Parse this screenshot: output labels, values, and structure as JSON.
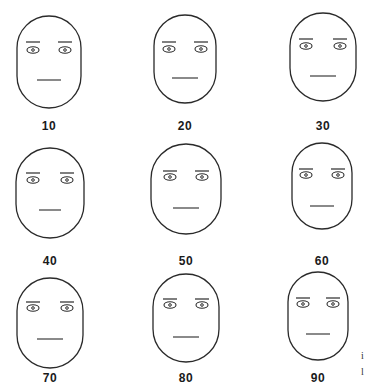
{
  "figure": {
    "stroke_color": "#2a2a2a",
    "background": "#ffffff"
  },
  "faces": [
    {
      "label": "10",
      "cx": 49,
      "cy": 62,
      "rx": 32,
      "ry": 46,
      "eye_y": 50,
      "eye_dx": 16,
      "brow_y": 42,
      "mouth_y": 80,
      "mouth_w": 24
    },
    {
      "label": "20",
      "cx": 185,
      "cy": 59,
      "rx": 31,
      "ry": 44,
      "eye_y": 49,
      "eye_dx": 16,
      "brow_y": 42,
      "mouth_y": 78,
      "mouth_w": 26
    },
    {
      "label": "30",
      "cx": 323,
      "cy": 57,
      "rx": 33,
      "ry": 44,
      "eye_y": 46,
      "eye_dx": 17,
      "brow_y": 39,
      "mouth_y": 76,
      "mouth_w": 26
    },
    {
      "label": "40",
      "cx": 50,
      "cy": 193,
      "rx": 34,
      "ry": 45,
      "eye_y": 180,
      "eye_dx": 17,
      "brow_y": 173,
      "mouth_y": 210,
      "mouth_w": 22
    },
    {
      "label": "50",
      "cx": 186,
      "cy": 189,
      "rx": 35,
      "ry": 45,
      "eye_y": 177,
      "eye_dx": 16,
      "brow_y": 171,
      "mouth_y": 208,
      "mouth_w": 26
    },
    {
      "label": "60",
      "cx": 322,
      "cy": 186,
      "rx": 30,
      "ry": 43,
      "eye_y": 175,
      "eye_dx": 16,
      "brow_y": 169,
      "mouth_y": 206,
      "mouth_w": 24
    },
    {
      "label": "70",
      "cx": 50,
      "cy": 323,
      "rx": 33,
      "ry": 45,
      "eye_y": 308,
      "eye_dx": 17,
      "brow_y": 302,
      "mouth_y": 339,
      "mouth_w": 26
    },
    {
      "label": "80",
      "cx": 186,
      "cy": 318,
      "rx": 33,
      "ry": 44,
      "eye_y": 305,
      "eye_dx": 16,
      "brow_y": 299,
      "mouth_y": 337,
      "mouth_w": 26
    },
    {
      "label": "90",
      "cx": 318,
      "cy": 316,
      "rx": 30,
      "ry": 44,
      "eye_y": 304,
      "eye_dx": 15,
      "brow_y": 298,
      "mouth_y": 334,
      "mouth_w": 24
    }
  ],
  "labels_y": [
    127,
    262,
    379
  ],
  "edge_fragment": {
    "line1": "i",
    "line2": "l"
  }
}
